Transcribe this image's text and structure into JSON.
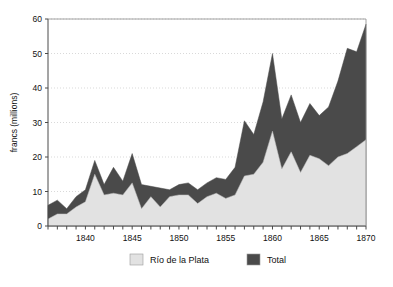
{
  "chart_data": {
    "type": "area",
    "title": "",
    "subtitle": "",
    "xlabel": "",
    "ylabel": "francs (millions)",
    "xlim": [
      1836,
      1870
    ],
    "ylim": [
      0,
      60
    ],
    "yticks": [
      0,
      10,
      20,
      30,
      40,
      50,
      60
    ],
    "ytick_labels": [
      "0",
      "10",
      "20",
      "30",
      "40",
      "50",
      "60"
    ],
    "xticks": [
      1840,
      1845,
      1850,
      1855,
      1860,
      1865,
      1870
    ],
    "xtick_labels": [
      "1840",
      "1845",
      "1850",
      "1855",
      "1860",
      "1865",
      "1870"
    ],
    "minor_xticks_every": 1,
    "grid": "horizontal-dotted",
    "legend_position": "bottom-center",
    "stacking": "overlaid-total",
    "x": [
      1836,
      1837,
      1838,
      1839,
      1840,
      1841,
      1842,
      1843,
      1844,
      1845,
      1846,
      1847,
      1848,
      1849,
      1850,
      1851,
      1852,
      1853,
      1854,
      1855,
      1856,
      1857,
      1858,
      1859,
      1860,
      1861,
      1862,
      1863,
      1864,
      1865,
      1866,
      1867,
      1868,
      1869,
      1870
    ],
    "series": [
      {
        "name": "Total",
        "color": "#4a4a4a",
        "values": [
          6.0,
          7.5,
          5.0,
          8.5,
          10.5,
          19.0,
          12.0,
          17.0,
          13.0,
          21.0,
          12.0,
          11.5,
          11.0,
          10.5,
          12.0,
          12.5,
          10.5,
          12.5,
          14.0,
          13.5,
          17.0,
          30.5,
          26.5,
          36.0,
          50.0,
          31.0,
          38.0,
          30.0,
          35.5,
          32.0,
          34.5,
          42.0,
          51.5,
          50.5,
          58.5
        ]
      },
      {
        "name": "Río de la Plata",
        "color": "#e2e2e2",
        "values": [
          2.0,
          3.5,
          3.5,
          5.5,
          7.0,
          15.0,
          9.0,
          9.5,
          9.0,
          12.5,
          5.0,
          8.5,
          5.5,
          8.5,
          9.0,
          9.0,
          6.5,
          8.5,
          9.5,
          8.0,
          9.0,
          14.5,
          15.0,
          18.5,
          27.5,
          16.5,
          21.5,
          15.5,
          20.5,
          19.5,
          17.5,
          20.0,
          21.0,
          23.0,
          25.0
        ]
      }
    ],
    "legend": [
      {
        "label": "Río de la Plata",
        "color": "#e2e2e2"
      },
      {
        "label": "Total",
        "color": "#4a4a4a"
      }
    ]
  }
}
